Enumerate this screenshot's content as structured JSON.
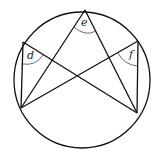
{
  "diagram": {
    "type": "inscribed-angles-circle",
    "circle": {
      "cx": 82,
      "cy": 80,
      "r": 68
    },
    "points": {
      "top": [
        85,
        10
      ],
      "left_upper": [
        23,
        42
      ],
      "right_upper": [
        138,
        41
      ],
      "bottom_left": [
        21,
        108
      ],
      "bottom_right": [
        137,
        113
      ]
    },
    "labels": {
      "d": "d",
      "e": "e",
      "f": "f"
    },
    "colors": {
      "stroke": "#111111",
      "arc": "#444444",
      "background": "#ffffff"
    }
  }
}
